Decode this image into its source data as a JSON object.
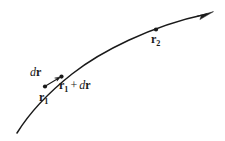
{
  "figure": {
    "kind": "vector-path-diagram",
    "background_color": "#ffffff",
    "ink_color": "#1a1a1a",
    "labels": {
      "dr": {
        "d": "d",
        "r": "r",
        "subscript": ""
      },
      "r1": {
        "r": "r",
        "subscript": "1"
      },
      "r1_plus_dr": {
        "r": "r",
        "subscript": "1",
        "operator": "+",
        "d": "d",
        "r2": "r"
      },
      "r2": {
        "r": "r",
        "subscript": "2"
      }
    },
    "markers": [
      {
        "name": "point-r1",
        "x": 45,
        "y": 86
      },
      {
        "name": "point-r1-plus-dr",
        "x": 61,
        "y": 77
      },
      {
        "name": "point-r2",
        "x": 156,
        "y": 29
      }
    ],
    "curve": {
      "name": "trajectory-curve",
      "start": [
        17,
        133
      ],
      "end": [
        212,
        13
      ],
      "arrowhead": true
    },
    "displacement_arrow": {
      "name": "dr-arrow",
      "start": [
        45,
        86
      ],
      "end": [
        60,
        77
      ]
    }
  }
}
